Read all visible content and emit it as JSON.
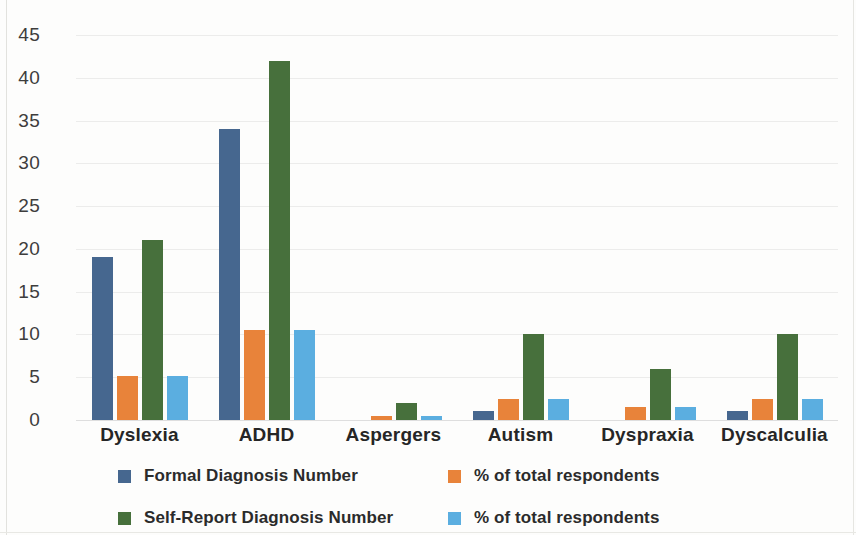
{
  "chart_data": {
    "type": "bar",
    "title": "",
    "subtitle": "",
    "xlabel": "",
    "ylabel": "",
    "ylim": [
      0,
      45
    ],
    "ytick_step": 5,
    "yticks": [
      45,
      40,
      35,
      30,
      25,
      20,
      15,
      10,
      5,
      0
    ],
    "grid": true,
    "grid_axis": "y",
    "legend_position": "bottom",
    "categories": [
      "Dyslexia",
      "ADHD",
      "Aspergers",
      "Autism",
      "Dyspraxia",
      "Dyscalculia"
    ],
    "series": [
      {
        "name": "Formal Diagnosis Number",
        "color": "#46678f",
        "values": [
          19,
          34,
          0,
          1,
          0,
          1
        ]
      },
      {
        "name": "% of total respondents",
        "color": "#e8833a",
        "values": [
          5.2,
          10.5,
          0.5,
          2.5,
          1.5,
          2.5
        ]
      },
      {
        "name": "Self-Report Diagnosis Number",
        "color": "#47703c",
        "values": [
          21,
          42,
          2,
          10,
          6,
          10
        ]
      },
      {
        "name": "% of total respondents",
        "color": "#5baee0",
        "values": [
          5.2,
          10.5,
          0.5,
          2.5,
          1.5,
          2.5
        ]
      }
    ]
  },
  "legend": {
    "items": [
      {
        "label": "Formal Diagnosis Number",
        "color": "#46678f",
        "icon": "square-swatch-icon"
      },
      {
        "label": "% of total respondents",
        "color": "#e8833a",
        "icon": "square-swatch-icon"
      },
      {
        "label": "Self-Report Diagnosis Number",
        "color": "#47703c",
        "icon": "square-swatch-icon"
      },
      {
        "label": "% of total respondents",
        "color": "#5baee0",
        "icon": "square-swatch-icon"
      }
    ]
  }
}
